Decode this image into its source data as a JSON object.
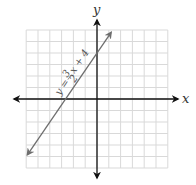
{
  "chart_data": {
    "type": "line",
    "title": "",
    "xlabel": "x",
    "ylabel": "y",
    "xlim": [
      -6,
      6
    ],
    "ylim": [
      -6,
      6
    ],
    "grid": true,
    "tick_labels": false,
    "series": [
      {
        "name": "y = 3/2 x + 4",
        "equation": "y = (3/2)x + 4",
        "slope": 1.5,
        "intercept": 4,
        "x": [
          -6,
          -4,
          -2.667,
          0,
          2
        ],
        "values": [
          -5,
          -2,
          0,
          4,
          7
        ],
        "arrows_both_ends": true
      }
    ],
    "annotations": [
      "y = 3/2 x + 4"
    ]
  },
  "labels": {
    "x_axis": "x",
    "y_axis": "y",
    "equation_prefix": "y = ",
    "equation_num": "3",
    "equation_den": "2",
    "equation_suffix": "x + 4"
  },
  "colors": {
    "grid": "#d9d9d9",
    "axis": "#111111",
    "line": "#6e6e6e"
  }
}
